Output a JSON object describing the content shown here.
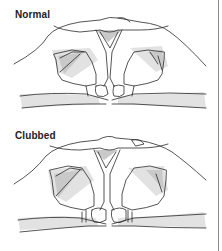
{
  "figure": {
    "panels": [
      {
        "label": "Normal",
        "illustration": "normal-fingers"
      },
      {
        "label": "Clubbed",
        "illustration": "clubbed-fingers"
      }
    ]
  },
  "colors": {
    "line": "#2a2a2a",
    "shade": "#c9c9c9",
    "border": "#8a8a8a",
    "background": "#ffffff"
  }
}
